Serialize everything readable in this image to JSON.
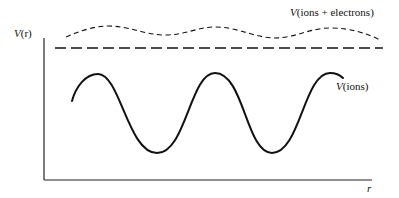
{
  "diagram": {
    "type": "potential-energy-sketch",
    "axes": {
      "y_label_prefix": "V",
      "y_label_suffix": "(r)",
      "x_label": "r"
    },
    "curves": [
      {
        "id": "ions",
        "label_prefix": "V",
        "label_suffix": "(ions)",
        "style": "solid",
        "description": "deep periodic oscillation"
      },
      {
        "id": "ions-electrons",
        "label_prefix": "V",
        "label_suffix": "(ions + electrons)",
        "style": "short-dashed",
        "description": "shallow periodic oscillation"
      },
      {
        "id": "average-level",
        "label": "",
        "style": "long-dashed",
        "description": "flat reference level"
      }
    ],
    "colors": {
      "line": "#111111",
      "background": "#ffffff"
    }
  }
}
